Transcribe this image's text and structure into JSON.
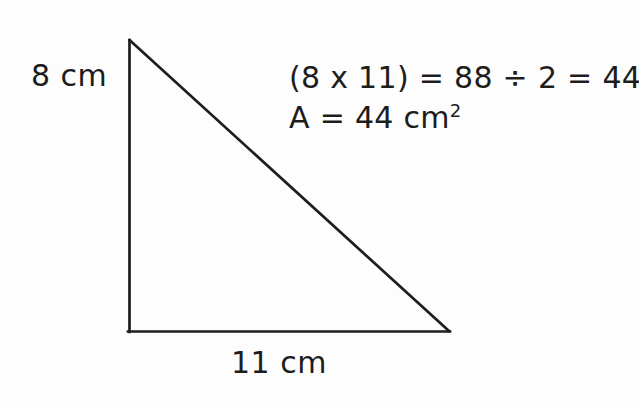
{
  "canvas": {
    "width": 639,
    "height": 409,
    "background_color": "#fdfdfd",
    "ink_color": "#1d1d1d"
  },
  "figure": {
    "shape_name": "right-triangle",
    "stroke_color": "#1d1d1d",
    "stroke_width": 2.6,
    "apex": {
      "x": 129,
      "y": 40
    },
    "bottom_left": {
      "x": 129,
      "y": 332
    },
    "bottom_right": {
      "x": 449,
      "y": 332
    }
  },
  "labels": {
    "height": "8 cm",
    "base": "11 cm"
  },
  "solution": {
    "line1": "(8 x 11) = 88 ÷ 2 = 44",
    "line2_prefix": "A = 44 cm",
    "line2_exponent": "2"
  }
}
